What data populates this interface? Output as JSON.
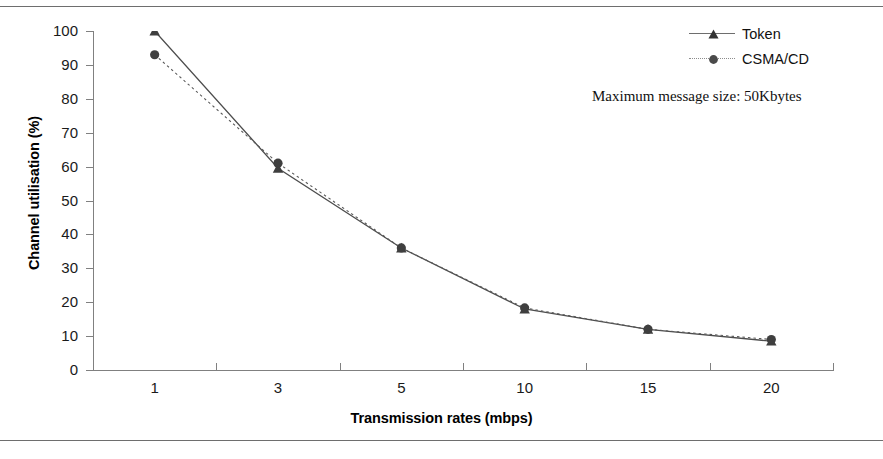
{
  "chart_data": {
    "type": "line",
    "title": "",
    "xlabel": "Transmission rates (mbps)",
    "ylabel": "Channel utilisation (%)",
    "categories": [
      "1",
      "3",
      "5",
      "10",
      "15",
      "20"
    ],
    "ylim": [
      0,
      100
    ],
    "yticks": [
      "0",
      "10",
      "20",
      "30",
      "40",
      "50",
      "60",
      "70",
      "80",
      "90",
      "100"
    ],
    "grid": false,
    "legend_position": "top-right",
    "series": [
      {
        "name": "Token",
        "marker": "triangle",
        "line_style": "solid",
        "color": "#4d4d4d",
        "values": [
          100,
          59.5,
          36,
          18,
          12,
          8.5
        ]
      },
      {
        "name": "CSMA/CD",
        "marker": "circle",
        "line_style": "dotted",
        "color": "#5a5a5a",
        "values": [
          93,
          61,
          36,
          18.3,
          12,
          9
        ]
      }
    ],
    "annotations": [
      {
        "text": "Maximum message size: 50Kbytes"
      }
    ]
  },
  "legend": {
    "items": [
      {
        "label": "Token"
      },
      {
        "label": "CSMA/CD"
      }
    ]
  },
  "annotation": {
    "text": "Maximum message size: 50Kbytes"
  },
  "axes": {
    "x_title": "Transmission rates (mbps)",
    "y_title": "Channel utilisation (%)"
  }
}
